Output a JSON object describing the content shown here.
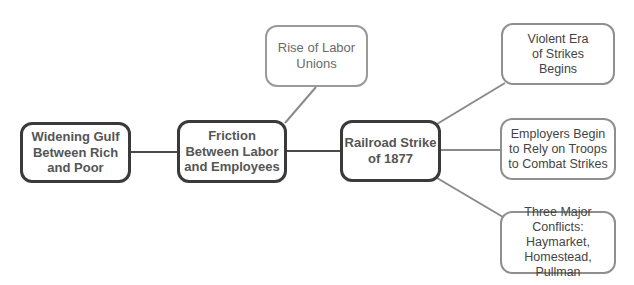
{
  "diagram": {
    "type": "concept-map",
    "nodes": {
      "widening_gulf": "Widening Gulf Between Rich and Poor",
      "friction": "Friction Between Labor and Employees",
      "railroad": "Railroad Strike of 1877",
      "labor_unions": "Rise of Labor Unions",
      "violent_era": "Violent Era of Strikes Begins",
      "employers_troops": "Employers Begin to Rely on Troops to Combat Strikes",
      "three_conflicts": "Three Major Conflicts: Haymarket, Homestead, Pullman"
    },
    "edges": [
      {
        "from": "widening_gulf",
        "to": "friction"
      },
      {
        "from": "friction",
        "to": "labor_unions"
      },
      {
        "from": "friction",
        "to": "railroad"
      },
      {
        "from": "railroad",
        "to": "violent_era"
      },
      {
        "from": "railroad",
        "to": "employers_troops"
      },
      {
        "from": "railroad",
        "to": "three_conflicts"
      }
    ],
    "colors": {
      "main_border": "#3a3a3a",
      "sub_border": "#8f8f8f",
      "line_dark": "#3a3a3a",
      "line_gray": "#8a8a8a"
    }
  }
}
